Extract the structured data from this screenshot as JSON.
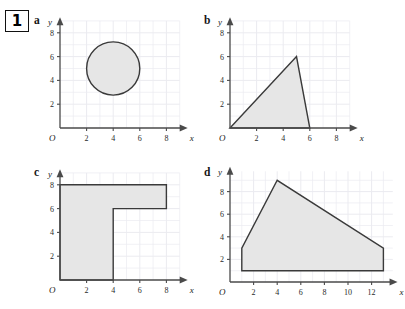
{
  "question": {
    "number": "1"
  },
  "axis": {
    "x_label": "x",
    "y_label": "y",
    "origin_label": "O"
  },
  "panels": [
    {
      "key": "a",
      "label": "a",
      "shape_name": "circle",
      "x_ticks": [
        2,
        4,
        6,
        8
      ],
      "y_ticks": [
        2,
        4,
        6,
        8
      ],
      "x_max": 9.6,
      "y_max": 9.3,
      "grid_x_max": 9,
      "grid_y_max": 9,
      "circle": {
        "cx": 4,
        "cy": 5,
        "r": 2
      }
    },
    {
      "key": "b",
      "label": "b",
      "shape_name": "triangle",
      "x_ticks": [
        2,
        4,
        6,
        8
      ],
      "y_ticks": [
        2,
        4,
        6,
        8
      ],
      "x_max": 9.6,
      "y_max": 9.3,
      "grid_x_max": 9,
      "grid_y_max": 9,
      "points": [
        [
          0,
          0
        ],
        [
          5,
          6
        ],
        [
          6,
          0
        ]
      ]
    },
    {
      "key": "c",
      "label": "c",
      "shape_name": "l-shape",
      "x_ticks": [
        2,
        4,
        6,
        8
      ],
      "y_ticks": [
        2,
        4,
        6,
        8
      ],
      "x_max": 9.6,
      "y_max": 9.3,
      "grid_x_max": 9,
      "grid_y_max": 9,
      "points": [
        [
          0,
          0
        ],
        [
          4,
          0
        ],
        [
          4,
          6
        ],
        [
          8,
          6
        ],
        [
          8,
          8
        ],
        [
          0,
          8
        ]
      ]
    },
    {
      "key": "d",
      "label": "d",
      "shape_name": "pentagon",
      "x_ticks": [
        2,
        4,
        6,
        8,
        10,
        12
      ],
      "y_ticks": [
        2,
        4,
        6,
        8
      ],
      "x_max": 14.2,
      "y_max": 10.2,
      "grid_x_max": 13.8,
      "grid_y_max": 9.8,
      "points": [
        [
          1,
          1
        ],
        [
          1,
          3
        ],
        [
          4,
          9
        ],
        [
          13,
          3
        ],
        [
          13,
          1
        ]
      ]
    }
  ],
  "colors": {
    "shape_fill": "#e6e6e6",
    "shape_stroke": "#3a3a3a",
    "grid": "#ebebf0",
    "axis": "#4a4a4a",
    "text": "#1a1a1a"
  }
}
